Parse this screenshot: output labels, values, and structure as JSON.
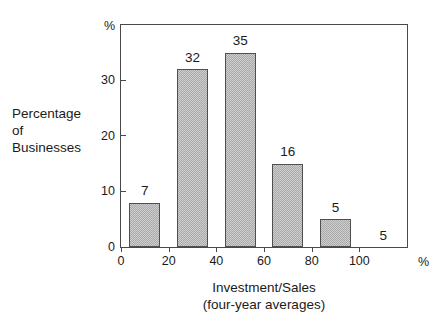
{
  "chart_data": {
    "type": "bar",
    "title": "",
    "xlabel": "Investment/Sales",
    "xlabel_line2": "(four-year averages)",
    "ylabel_lines": [
      "Percentage",
      "of",
      "Businesses"
    ],
    "x_unit": "%",
    "y_unit": "%",
    "xlim": [
      0,
      120
    ],
    "ylim": [
      0,
      40
    ],
    "grid": false,
    "legend": null,
    "x_ticks": [
      {
        "value": 0,
        "label": "0"
      },
      {
        "value": 20,
        "label": "20"
      },
      {
        "value": 40,
        "label": "40"
      },
      {
        "value": 60,
        "label": "60"
      },
      {
        "value": 80,
        "label": "80"
      },
      {
        "value": 100,
        "label": "100"
      }
    ],
    "y_ticks": [
      {
        "value": 0,
        "label": "0"
      },
      {
        "value": 10,
        "label": "10"
      },
      {
        "value": 20,
        "label": "20"
      },
      {
        "value": 30,
        "label": "30"
      }
    ],
    "categories": [
      "0-20",
      "20-40",
      "40-60",
      "60-80",
      "80-100",
      "100+"
    ],
    "values": [
      7,
      32,
      35,
      16,
      5,
      5
    ],
    "bars": [
      {
        "label": "7",
        "value": 7,
        "drawn_height": 8,
        "bin_start": 0,
        "bin_end": 20,
        "visible": true
      },
      {
        "label": "32",
        "value": 32,
        "drawn_height": 32,
        "bin_start": 20,
        "bin_end": 40,
        "visible": true
      },
      {
        "label": "35",
        "value": 35,
        "drawn_height": 35,
        "bin_start": 40,
        "bin_end": 60,
        "visible": true
      },
      {
        "label": "16",
        "value": 16,
        "drawn_height": 15,
        "bin_start": 60,
        "bin_end": 80,
        "visible": true
      },
      {
        "label": "5",
        "value": 5,
        "drawn_height": 5,
        "bin_start": 80,
        "bin_end": 100,
        "visible": true
      },
      {
        "label": "5",
        "value": 5,
        "drawn_height": 0,
        "bin_start": 100,
        "bin_end": 120,
        "visible": false
      }
    ],
    "colors": {
      "bar_fill": "#cfcfcf",
      "bar_hatch": "#a9a9a9",
      "bar_edge": "#4f4f4f",
      "axis": "#4a4a4a",
      "text": "#1a1a1a",
      "background": "#ffffff"
    }
  }
}
